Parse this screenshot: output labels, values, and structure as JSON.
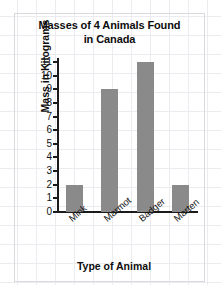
{
  "chart_data": {
    "type": "bar",
    "title": "Masses of 4 Animals Found in Canada",
    "title_line1": "Masses of 4 Animals Found",
    "title_line2": "in Canada",
    "xlabel": "Type of Animal",
    "ylabel": "Mass in Kilograms",
    "categories": [
      "Mink",
      "Marmot",
      "Badger",
      "Marten"
    ],
    "values": [
      2,
      9,
      11,
      2
    ],
    "ylim": [
      0,
      11
    ],
    "ytick_labels": [
      "11",
      "10",
      "9",
      "8",
      "7",
      "6",
      "5",
      "4",
      "3",
      "2",
      "1",
      "0"
    ],
    "ytick_values": [
      11,
      10,
      9,
      8,
      7,
      6,
      5,
      4,
      3,
      2,
      1,
      0
    ],
    "ytick_step": 1,
    "grid": false,
    "legend": "none",
    "bar_color": "#8a8a8a",
    "axis_color": "#1b1b1b",
    "background_color": "#ffffff",
    "grid_paper_color": "#ececf0"
  }
}
